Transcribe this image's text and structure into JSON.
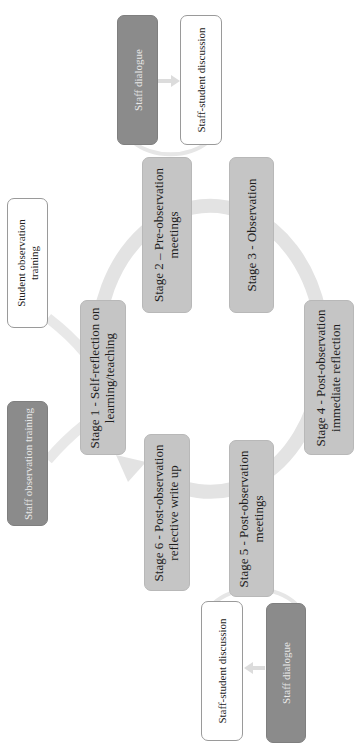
{
  "diagram": {
    "colors": {
      "stage_fill": "#c5c5c5",
      "dark_fill": "#8b8b8b",
      "white_fill": "#ffffff",
      "connector": "#e4e4e4"
    },
    "stages": [
      {
        "id": "stage1",
        "line1": "Stage 1 - Self-reflection on",
        "line2": "learning/teaching"
      },
      {
        "id": "stage2",
        "line1": "Stage 2 – Pre-observation",
        "line2": "meetings"
      },
      {
        "id": "stage3",
        "line1": "Stage 3 - Observation",
        "line2": ""
      },
      {
        "id": "stage4",
        "line1": "Stage 4 - Post-observation",
        "line2": "immediate reflection"
      },
      {
        "id": "stage5",
        "line1": "Stage 5 -  Post-observation",
        "line2": "meetings"
      },
      {
        "id": "stage6",
        "line1": "Stage 6 - Post-observation",
        "line2": "reflective write up"
      }
    ],
    "satellites": {
      "top_dark": "Staff dialogue",
      "top_white": "Staff-student discussion",
      "bottom_white": "Staff-student discussion",
      "bottom_dark": "Staff dialogue",
      "student_training_line1": "Student observation",
      "student_training_line2": "training",
      "staff_training": "Staff observation training"
    },
    "cycle_direction": "clockwise, arrow returning to Stage 1"
  }
}
